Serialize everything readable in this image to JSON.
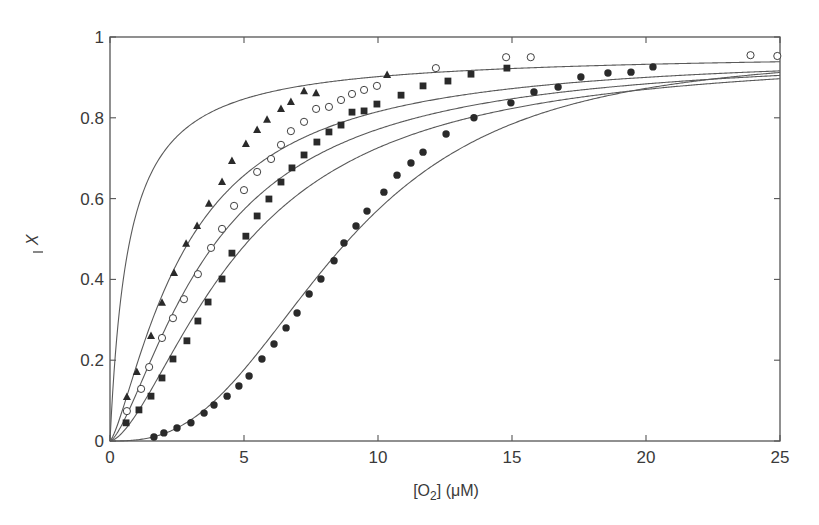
{
  "chart_data": {
    "type": "scatter",
    "title": "",
    "xlabel": "[O2] (μM)",
    "xlabel_parts": {
      "pre": "[O",
      "sub": "2",
      "post": "] (μM)"
    },
    "ylabel": "X̄",
    "xlim": [
      0,
      25
    ],
    "ylim": [
      0,
      1
    ],
    "xticks": [
      0,
      5,
      10,
      15,
      20,
      25
    ],
    "yticks": [
      0,
      0.2,
      0.4,
      0.6,
      0.8,
      1
    ],
    "ytick_labels": [
      "0",
      "0.2",
      "0.4",
      "0.6",
      "0.8",
      "1"
    ],
    "grid": false,
    "legend": null,
    "fit_curves": [
      {
        "name": "curve-no-data",
        "ymax": 0.965,
        "p50": 0.7,
        "n": 1.0
      },
      {
        "name": "curve-triangles",
        "ymax": 0.965,
        "p50": 2.85,
        "n": 1.35
      },
      {
        "name": "curve-open-circles",
        "ymax": 0.965,
        "p50": 3.85,
        "n": 1.45
      },
      {
        "name": "curve-squares",
        "ymax": 0.965,
        "p50": 5.0,
        "n": 1.6
      },
      {
        "name": "curve-filled-circles",
        "ymax": 0.965,
        "p50": 8.7,
        "n": 2.7
      }
    ],
    "series": [
      {
        "name": "triangles",
        "marker": "filled-triangle",
        "x": [
          0.63,
          1.0,
          1.53,
          1.94,
          2.39,
          2.84,
          3.25,
          3.69,
          4.18,
          4.55,
          5.07,
          5.49,
          5.86,
          6.38,
          6.75,
          7.24,
          7.69,
          10.34
        ],
        "y": [
          0.109,
          0.171,
          0.26,
          0.342,
          0.416,
          0.488,
          0.532,
          0.587,
          0.641,
          0.693,
          0.735,
          0.77,
          0.795,
          0.822,
          0.839,
          0.866,
          0.861,
          0.906
        ]
      },
      {
        "name": "open-circles",
        "marker": "open-circle",
        "x": [
          0.63,
          1.16,
          1.46,
          1.94,
          2.35,
          2.76,
          3.28,
          3.77,
          4.18,
          4.63,
          5.0,
          5.49,
          6.01,
          6.38,
          6.75,
          7.24,
          7.69,
          8.17,
          8.62,
          9.03,
          9.48,
          9.96,
          12.16,
          14.78,
          15.7,
          23.9,
          24.9
        ],
        "y": [
          0.074,
          0.129,
          0.183,
          0.255,
          0.304,
          0.351,
          0.413,
          0.478,
          0.525,
          0.582,
          0.621,
          0.666,
          0.698,
          0.733,
          0.767,
          0.79,
          0.822,
          0.827,
          0.844,
          0.859,
          0.869,
          0.879,
          0.923,
          0.95,
          0.95,
          0.955,
          0.953
        ]
      },
      {
        "name": "squares",
        "marker": "filled-square",
        "x": [
          0.6,
          1.08,
          1.53,
          1.94,
          2.35,
          2.87,
          3.28,
          3.66,
          4.18,
          4.55,
          5.07,
          5.49,
          5.93,
          6.38,
          6.79,
          7.24,
          7.72,
          8.17,
          8.62,
          9.03,
          9.48,
          9.96,
          10.86,
          11.68,
          12.61,
          13.47,
          14.81
        ],
        "y": [
          0.045,
          0.077,
          0.111,
          0.156,
          0.203,
          0.248,
          0.297,
          0.344,
          0.401,
          0.465,
          0.507,
          0.557,
          0.599,
          0.641,
          0.676,
          0.708,
          0.74,
          0.765,
          0.782,
          0.814,
          0.817,
          0.834,
          0.856,
          0.879,
          0.891,
          0.908,
          0.923
        ]
      },
      {
        "name": "filled-circles",
        "marker": "filled-circle",
        "x": [
          1.64,
          2.01,
          2.5,
          3.02,
          3.51,
          3.88,
          4.37,
          4.81,
          5.19,
          5.67,
          6.12,
          6.57,
          6.98,
          7.43,
          7.87,
          8.36,
          8.73,
          9.18,
          9.59,
          10.22,
          10.71,
          11.23,
          11.68,
          12.54,
          13.58,
          14.96,
          15.82,
          16.72,
          17.57,
          18.58,
          19.44,
          20.26
        ],
        "y": [
          0.01,
          0.02,
          0.032,
          0.045,
          0.069,
          0.089,
          0.111,
          0.136,
          0.161,
          0.203,
          0.24,
          0.28,
          0.317,
          0.364,
          0.401,
          0.446,
          0.49,
          0.532,
          0.569,
          0.616,
          0.658,
          0.688,
          0.715,
          0.76,
          0.8,
          0.837,
          0.864,
          0.876,
          0.901,
          0.911,
          0.913,
          0.926
        ]
      }
    ]
  },
  "colors": {
    "axis": "#555555",
    "curve": "#5a5a5a",
    "marker": "#2a2a2a",
    "text": "#3a3a3a"
  }
}
